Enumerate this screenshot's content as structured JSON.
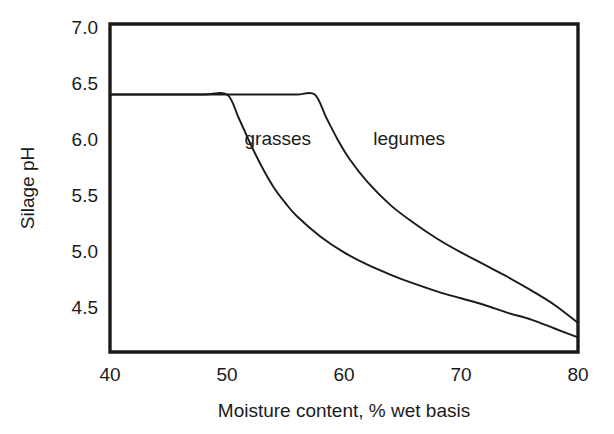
{
  "chart_data": {
    "type": "line",
    "title": "",
    "xlabel": "Moisture content, % wet basis",
    "ylabel": "Silage pH",
    "xlim": [
      40,
      80
    ],
    "ylim": [
      4.11,
      7.04
    ],
    "xticks": [
      40,
      50,
      60,
      70,
      80
    ],
    "xtick_labels": [
      "40",
      "50",
      "60",
      "70",
      "80"
    ],
    "yticks": [
      4.5,
      5.0,
      5.5,
      6.0,
      6.5,
      7.0
    ],
    "ytick_labels": [
      "4.5",
      "5.0",
      "5.5",
      "6.0",
      "6.5",
      "7.0"
    ],
    "grid": false,
    "legend": "inline-annotations",
    "annotations": [
      {
        "text": "grasses",
        "x": 51.5,
        "y": 6.0
      },
      {
        "text": "legumes",
        "x": 62.5,
        "y": 6.0
      }
    ],
    "series": [
      {
        "name": "grasses",
        "x": [
          40,
          44,
          48,
          50,
          51,
          52,
          53,
          54,
          55,
          56,
          58,
          60,
          62,
          64,
          66,
          68,
          70,
          72,
          74,
          76,
          78,
          80
        ],
        "y": [
          6.41,
          6.41,
          6.41,
          6.41,
          6.2,
          5.97,
          5.76,
          5.58,
          5.44,
          5.32,
          5.14,
          5.0,
          4.89,
          4.8,
          4.72,
          4.65,
          4.59,
          4.53,
          4.46,
          4.4,
          4.32,
          4.24
        ]
      },
      {
        "name": "legumes",
        "x": [
          40,
          45,
          50,
          54,
          56,
          57.5,
          58.5,
          59.5,
          60.5,
          62,
          64,
          66,
          68,
          70,
          72,
          74,
          76,
          78,
          80
        ],
        "y": [
          6.41,
          6.41,
          6.41,
          6.41,
          6.41,
          6.41,
          6.2,
          6.0,
          5.83,
          5.63,
          5.42,
          5.26,
          5.12,
          5.0,
          4.89,
          4.78,
          4.66,
          4.53,
          4.37
        ]
      }
    ]
  },
  "axes": {
    "frame_color": "#1a1a1a",
    "curve_color": "#1a1a1a",
    "background": "#ffffff"
  }
}
